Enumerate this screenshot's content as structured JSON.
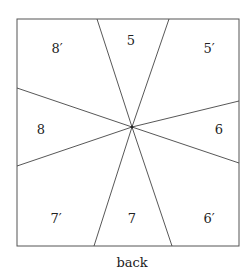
{
  "diagram": {
    "caption": "back",
    "labels": {
      "top": "5",
      "top_right": "5′",
      "top_left": "8′",
      "left": "8",
      "right": "6",
      "bottom_left": "7′",
      "bottom": "7",
      "bottom_right": "6′"
    },
    "stroke_color": "#444444"
  }
}
